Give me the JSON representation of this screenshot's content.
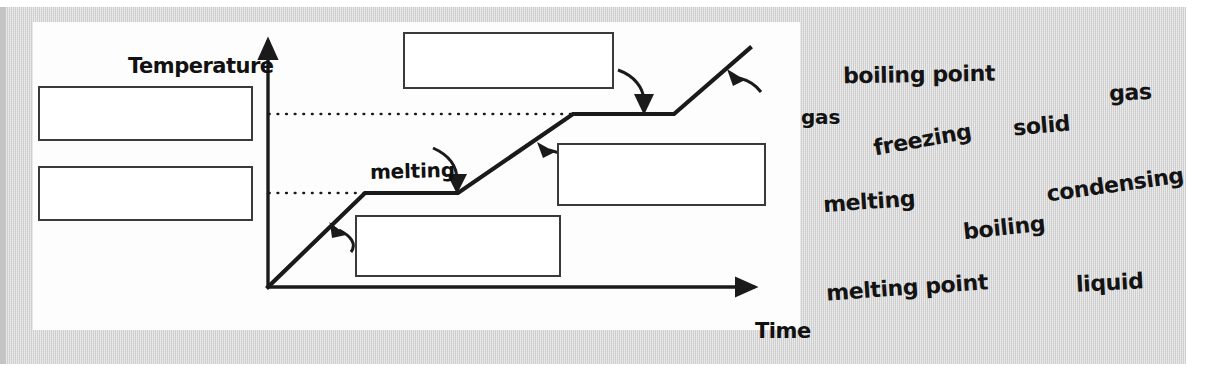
{
  "page": {
    "background": "#ffffff",
    "panel_color": "#d2d2d2",
    "card_color": "#fdfdfd",
    "ink_color": "#1a1a1a"
  },
  "diagram": {
    "y_axis_label": "Temperature",
    "x_axis_label": "Time",
    "callouts": [
      {
        "name": "melting",
        "text": "melting"
      },
      {
        "name": "gas",
        "text": "gas"
      }
    ],
    "ghost_bleed_text": "heater",
    "answer_boxes": [
      {
        "name": "answer-box-left-top",
        "value": ""
      },
      {
        "name": "answer-box-left-bottom",
        "value": ""
      },
      {
        "name": "answer-box-top-center",
        "value": ""
      },
      {
        "name": "answer-box-right-middle",
        "value": ""
      },
      {
        "name": "answer-box-bottom-center",
        "value": ""
      }
    ]
  },
  "word_bank": {
    "words": [
      {
        "label": "boiling point",
        "x": 843,
        "y": 62,
        "size": 22,
        "rot": -1
      },
      {
        "label": "gas",
        "x": 1109,
        "y": 80,
        "size": 22,
        "rot": -3
      },
      {
        "label": "freezing",
        "x": 873,
        "y": 127,
        "size": 22,
        "rot": -10
      },
      {
        "label": "solid",
        "x": 1013,
        "y": 113,
        "size": 22,
        "rot": -5
      },
      {
        "label": "condensing",
        "x": 1046,
        "y": 172,
        "size": 22,
        "rot": -8
      },
      {
        "label": "melting",
        "x": 823,
        "y": 189,
        "size": 22,
        "rot": -4
      },
      {
        "label": "boiling",
        "x": 963,
        "y": 215,
        "size": 22,
        "rot": -6
      },
      {
        "label": "melting point",
        "x": 826,
        "y": 275,
        "size": 22,
        "rot": -4
      },
      {
        "label": "liquid",
        "x": 1076,
        "y": 270,
        "size": 22,
        "rot": -3
      }
    ]
  },
  "chart_data": {
    "type": "line",
    "title": "",
    "xlabel": "Time",
    "ylabel": "Temperature",
    "grid": false,
    "legend": null,
    "annotations": [
      "melting",
      "gas"
    ],
    "reference_lines": [
      {
        "name": "melting point",
        "y": 193,
        "style": "dotted",
        "x_from": 268,
        "x_to": 365
      },
      {
        "name": "boiling point",
        "y": 114,
        "style": "dotted",
        "x_from": 268,
        "x_to": 570
      }
    ],
    "axes": {
      "origin": [
        268,
        287
      ],
      "y_top": 35,
      "x_right": 760
    },
    "series": [
      {
        "name": "heating curve",
        "points": [
          [
            268,
            287
          ],
          [
            365,
            193
          ],
          [
            458,
            193
          ],
          [
            570,
            114
          ],
          [
            674,
            114
          ],
          [
            750,
            48
          ]
        ]
      }
    ],
    "segments": [
      {
        "phase": "solid heating",
        "shape": "rising"
      },
      {
        "phase": "melting",
        "shape": "plateau"
      },
      {
        "phase": "liquid heating",
        "shape": "rising"
      },
      {
        "phase": "boiling",
        "shape": "plateau"
      },
      {
        "phase": "gas heating",
        "shape": "rising"
      }
    ]
  }
}
